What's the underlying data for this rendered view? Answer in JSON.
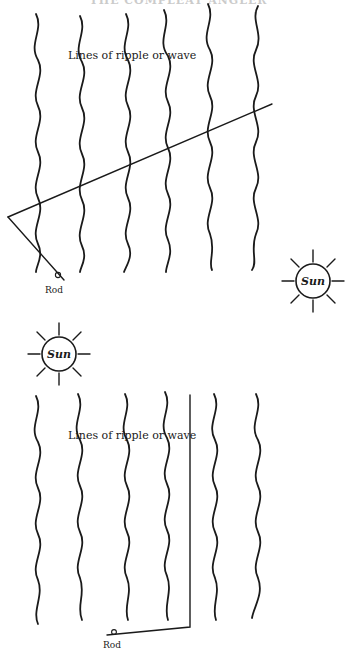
{
  "page": {
    "running_head": "THE COMPLEAT ANGLER"
  },
  "figure_top": {
    "wave_label": "Lines of ripple or wave",
    "rod_label": "Rod",
    "sun_label": "Sun",
    "wave_columns_x": [
      38,
      82,
      128,
      168,
      210,
      256
    ],
    "sun_position": "right",
    "description": "Sun to the side; rod's cast line crosses wave lines at an angle"
  },
  "figure_bottom": {
    "wave_label": "Lines of ripple or wave",
    "rod_label": "Rod",
    "sun_label": "Sun",
    "wave_columns_x": [
      38,
      80,
      127,
      167,
      215,
      258
    ],
    "sun_position": "upper-left",
    "description": "Line runs parallel to the wave lines"
  },
  "colors": {
    "ink": "#1a1a1a",
    "paper": "#ffffff"
  }
}
